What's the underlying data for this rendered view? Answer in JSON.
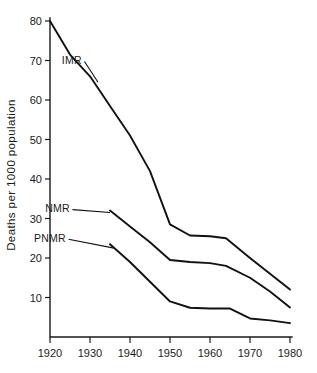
{
  "chart_data": {
    "type": "line",
    "title": "",
    "xlabel": "",
    "ylabel": "Deaths per 1000 population",
    "xlim": [
      1920,
      1980
    ],
    "ylim": [
      0,
      80
    ],
    "grid": false,
    "legend_position": "inline-labels",
    "x_ticks": [
      1920,
      1930,
      1940,
      1950,
      1960,
      1970,
      1980
    ],
    "x_tick_labels": [
      "1920",
      "1930",
      "1940",
      "1950",
      "1960",
      "1970",
      "1980"
    ],
    "y_ticks": [
      10,
      20,
      30,
      40,
      50,
      60,
      70,
      80
    ],
    "y_tick_labels": [
      "10",
      "20",
      "30",
      "40",
      "50",
      "60",
      "70",
      "80"
    ],
    "series": [
      {
        "name": "IMR",
        "label": "IMR",
        "color": "#111111",
        "label_x": 1928,
        "label_y": 70,
        "x": [
          1920,
          1925,
          1930,
          1935,
          1940,
          1945,
          1950,
          1955,
          1960,
          1964,
          1970,
          1975,
          1980
        ],
        "values": [
          80,
          71.5,
          66,
          58.5,
          51,
          42,
          28.5,
          25.7,
          25.5,
          25,
          20,
          16,
          12
        ]
      },
      {
        "name": "NMR",
        "label": "NMR",
        "color": "#111111",
        "label_x": 1925,
        "label_y": 32.5,
        "x": [
          1935,
          1940,
          1945,
          1950,
          1955,
          1960,
          1964,
          1970,
          1975,
          1980
        ],
        "values": [
          32,
          28,
          24,
          19.5,
          19,
          18.7,
          18,
          15,
          11.5,
          7.5
        ]
      },
      {
        "name": "PNMR",
        "label": "PNMR",
        "color": "#111111",
        "label_x": 1924,
        "label_y": 25,
        "x": [
          1935,
          1940,
          1945,
          1950,
          1955,
          1960,
          1965,
          1970,
          1975,
          1980
        ],
        "values": [
          23.5,
          19,
          14,
          9,
          7.4,
          7.2,
          7.2,
          4.7,
          4.2,
          3.5
        ]
      }
    ],
    "annotations": [
      {
        "text": "IMR",
        "target_x": 1932,
        "target_y": 64.5
      },
      {
        "text": "NMR",
        "target_x": 1935,
        "target_y": 31.5
      },
      {
        "text": "PNMR",
        "target_x": 1936,
        "target_y": 22.5
      }
    ]
  },
  "axis": {
    "y_title": "Deaths per 1000 population"
  }
}
